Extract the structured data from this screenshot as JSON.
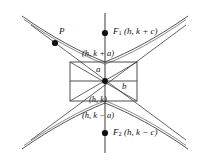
{
  "figure": {
    "type": "hyperbola-diagram",
    "colors": {
      "stroke": "#3b3b3b",
      "curve": "#555555",
      "point": "#111111",
      "background": "#ffffff",
      "text": "#111111"
    },
    "labels": {
      "point_p": "P",
      "focus_1_name": "F",
      "focus_1_sub": "1",
      "focus_1_coords": "(h, k + c)",
      "focus_2_name": "F",
      "focus_2_sub": "2",
      "focus_2_coords": "(h, k − c)",
      "vertex_top": "(h, k + a)",
      "vertex_bottom": "(h, k − a)",
      "center": "(h, k)",
      "semi_axis_a": "a",
      "semi_axis_b": "b"
    },
    "geometry": {
      "center": {
        "x": 105,
        "y": 81
      },
      "rect": {
        "left": 70,
        "top": 62,
        "right": 137,
        "bottom": 101
      },
      "focus_1": {
        "x": 105,
        "y": 33
      },
      "focus_2": {
        "x": 105,
        "y": 133
      },
      "vertex_top": {
        "x": 105,
        "y": 62
      },
      "vertex_bottom": {
        "x": 105,
        "y": 101
      },
      "point_p": {
        "x": 55,
        "y": 43
      },
      "axis_line": {
        "x": 105,
        "y1": 13,
        "y2": 153
      }
    }
  }
}
